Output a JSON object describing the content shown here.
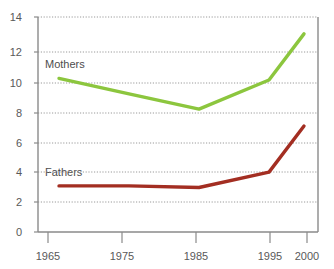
{
  "chart_data": {
    "type": "line",
    "title": "",
    "xlabel": "",
    "ylabel": "",
    "x": [
      1965,
      1975,
      1985,
      1995,
      2000
    ],
    "xlim": [
      1962,
      2002
    ],
    "ylim": [
      0,
      14
    ],
    "yticks": [
      0,
      2,
      4,
      6,
      8,
      10,
      12,
      14
    ],
    "xticks": [
      1965,
      1975,
      1985,
      1995,
      2000
    ],
    "grid": "horizontal-dotted",
    "legend": "inline-labels",
    "series": [
      {
        "name": "Mothers",
        "color": "#8CC63E",
        "values": [
          10.0,
          9.0,
          8.0,
          9.9,
          12.9
        ]
      },
      {
        "name": "Fathers",
        "color": "#A32E22",
        "values": [
          3.0,
          3.0,
          2.9,
          3.9,
          6.9
        ]
      }
    ]
  },
  "axis": {
    "y_labels": [
      "14",
      "12",
      "10",
      "8",
      "6",
      "4",
      "2",
      "0"
    ],
    "x_labels": [
      "1965",
      "1975",
      "1985",
      "1995",
      "2000"
    ]
  },
  "labels": {
    "mothers": "Mothers",
    "fathers": "Fathers"
  },
  "title_fragment": ""
}
